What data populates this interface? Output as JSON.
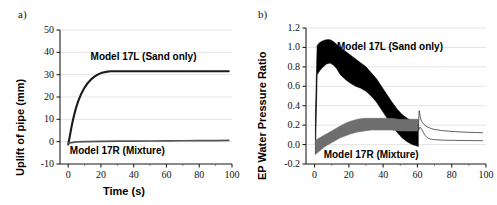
{
  "figure": {
    "panel_a_letter": "a)",
    "panel_b_letter": "b)"
  },
  "chart_data": [
    {
      "type": "line",
      "panel": "a",
      "title": "",
      "xlabel": "Time (s)",
      "ylabel": "Uplift of pipe (mm)",
      "xlim": [
        -5,
        100
      ],
      "ylim": [
        -10,
        50
      ],
      "xticks": [
        0,
        20,
        40,
        60,
        80,
        100
      ],
      "yticks": [
        -10,
        0,
        10,
        20,
        30,
        40,
        50
      ],
      "xtick_labels": [
        "0",
        "20",
        "40",
        "60",
        "80",
        "100"
      ],
      "ytick_labels": [
        "-10",
        "0",
        "10",
        "20",
        "30",
        "40",
        "50"
      ],
      "grid": "horizontal",
      "legend_position": "inline-annotation",
      "series": [
        {
          "name": "Model 17L (Sand only)",
          "color": "#1a1a1a",
          "annotation": "Model 17L (Sand only)",
          "annotation_x": 46,
          "annotation_y": 38,
          "x": [
            0,
            1,
            2,
            3,
            4,
            5,
            6,
            8,
            10,
            12,
            14,
            16,
            18,
            20,
            22,
            24,
            26,
            27,
            30,
            40,
            50,
            60,
            70,
            80,
            90,
            98
          ],
          "y": [
            -1.2,
            2.5,
            6.5,
            10.0,
            13.0,
            15.6,
            17.9,
            21.5,
            24.2,
            26.3,
            27.9,
            29.1,
            30.0,
            30.7,
            31.1,
            31.35,
            31.5,
            31.5,
            31.5,
            31.5,
            31.5,
            31.5,
            31.5,
            31.5,
            31.5,
            31.5
          ]
        },
        {
          "name": "Model 17R (Mixture)",
          "color": "#555555",
          "annotation": "Model 17R (Mixture)",
          "annotation_x": 30,
          "annotation_y": -4.2,
          "x": [
            0,
            2,
            5,
            10,
            20,
            30,
            40,
            50,
            60,
            70,
            80,
            90,
            98
          ],
          "y": [
            -0.9,
            -0.4,
            -0.1,
            0.05,
            0.15,
            0.2,
            0.25,
            0.3,
            0.35,
            0.4,
            0.45,
            0.5,
            0.55
          ]
        }
      ]
    },
    {
      "type": "line",
      "panel": "b",
      "title": "",
      "xlabel": "",
      "ylabel": "EP Water Pressure Ratio",
      "xlim": [
        -5,
        100
      ],
      "ylim": [
        -0.2,
        1.2
      ],
      "xticks": [
        0,
        20,
        40,
        60,
        80,
        100
      ],
      "yticks": [
        -0.2,
        0.0,
        0.2,
        0.4,
        0.6,
        0.8,
        1.0,
        1.2
      ],
      "xtick_labels": [
        "0",
        "20",
        "40",
        "60",
        "80",
        "100"
      ],
      "ytick_labels": [
        "-0.2",
        "0.0",
        "0.2",
        "0.4",
        "0.6",
        "0.8",
        "1.0",
        "1.2"
      ],
      "grid": "horizontal",
      "legend_position": "inline-annotation",
      "series": [
        {
          "name": "Model 17L (Sand only)",
          "color": "#000000",
          "style": "oscillation-envelope",
          "annotation": "Model 17L (Sand only)",
          "annotation_x": 44,
          "annotation_y": 1.0,
          "x": [
            0.5,
            1.5,
            3,
            5,
            7,
            9,
            11,
            13,
            15,
            18,
            21,
            24,
            27,
            30,
            33,
            36,
            39,
            42,
            45,
            48,
            51,
            54,
            57,
            59,
            60.5
          ],
          "upper": [
            0.3,
            1.02,
            1.05,
            1.07,
            1.08,
            1.08,
            1.06,
            1.03,
            1.0,
            0.96,
            0.92,
            0.88,
            0.84,
            0.8,
            0.74,
            0.68,
            0.6,
            0.52,
            0.44,
            0.37,
            0.31,
            0.27,
            0.24,
            0.22,
            0.21
          ],
          "lower": [
            -0.1,
            0.72,
            0.76,
            0.8,
            0.83,
            0.84,
            0.82,
            0.78,
            0.72,
            0.67,
            0.63,
            0.6,
            0.58,
            0.55,
            0.5,
            0.44,
            0.36,
            0.28,
            0.2,
            0.13,
            0.07,
            0.03,
            0.0,
            -0.01,
            -0.02
          ]
        },
        {
          "name": "Model 17R (Mixture)",
          "color": "#6e6e6e",
          "style": "oscillation-envelope",
          "annotation": "Model 17R (Mixture)",
          "annotation_x": 33,
          "annotation_y": -0.11,
          "x": [
            0.5,
            2,
            4,
            6,
            9,
            12,
            15,
            18,
            21,
            25,
            29,
            33,
            37,
            41,
            45,
            49,
            53,
            57,
            60.5
          ],
          "upper": [
            0.04,
            0.06,
            0.08,
            0.1,
            0.13,
            0.16,
            0.19,
            0.22,
            0.24,
            0.26,
            0.27,
            0.27,
            0.27,
            0.27,
            0.27,
            0.26,
            0.26,
            0.26,
            0.26
          ],
          "lower": [
            -0.1,
            -0.08,
            -0.05,
            -0.02,
            0.01,
            0.04,
            0.07,
            0.09,
            0.11,
            0.13,
            0.14,
            0.15,
            0.15,
            0.15,
            0.15,
            0.14,
            0.14,
            0.14,
            0.14
          ]
        },
        {
          "name": "Model 17L post-spike decay",
          "color": "#3a3a3a",
          "style": "thin-line",
          "x": [
            60.5,
            61.0,
            61.5,
            62,
            62.5,
            63,
            64,
            65,
            66,
            68,
            70,
            74,
            78,
            82,
            86,
            90,
            94,
            98
          ],
          "y": [
            0.14,
            0.35,
            0.3,
            0.26,
            0.24,
            0.225,
            0.205,
            0.19,
            0.18,
            0.165,
            0.155,
            0.145,
            0.138,
            0.133,
            0.129,
            0.126,
            0.124,
            0.122
          ]
        },
        {
          "name": "Model 17R post-spike decay",
          "color": "#3a3a3a",
          "style": "thin-line",
          "x": [
            60.5,
            61.5,
            62.5,
            63.5,
            64.5,
            65.5,
            66.5,
            68,
            70,
            74,
            78,
            82,
            86,
            90,
            94,
            98
          ],
          "y": [
            0.14,
            0.18,
            0.155,
            0.125,
            0.095,
            0.075,
            0.063,
            0.055,
            0.05,
            0.046,
            0.044,
            0.043,
            0.042,
            0.041,
            0.04,
            0.04
          ]
        }
      ]
    }
  ]
}
